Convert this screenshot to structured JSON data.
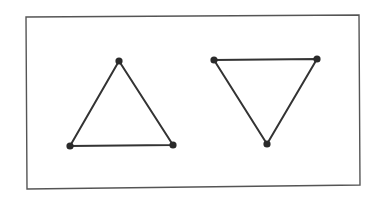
{
  "diagram": {
    "width": 385,
    "height": 199,
    "background": "#ffffff",
    "frame": {
      "points": [
        [
          26,
          17
        ],
        [
          359,
          15
        ],
        [
          360,
          185
        ],
        [
          27,
          189
        ]
      ],
      "stroke": "#555555",
      "stroke_width": 1.4
    },
    "line_color": "#333333",
    "vertex_color": "#2a2a2a",
    "line_width": 2,
    "vertex_radius": 3.6,
    "shapes": [
      {
        "name": "upward-triangle",
        "orientation": "pointing-up",
        "vertices": [
          [
            119,
            61
          ],
          [
            70,
            146
          ],
          [
            173,
            145
          ]
        ]
      },
      {
        "name": "downward-triangle",
        "orientation": "pointing-down",
        "vertices": [
          [
            214,
            60
          ],
          [
            317,
            59
          ],
          [
            267,
            144
          ]
        ]
      }
    ]
  }
}
